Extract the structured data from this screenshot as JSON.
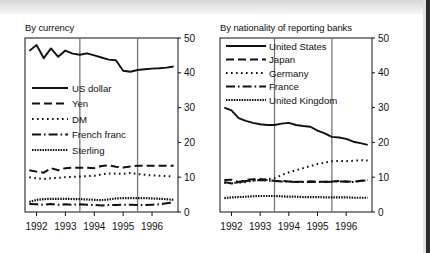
{
  "figure": {
    "background_color": "#ffffff",
    "ink_color": "#111111",
    "gridline_color": "#777777"
  },
  "panels": [
    {
      "id": "by-currency",
      "title": "By currency",
      "chart_data": {
        "type": "line",
        "title": "By currency",
        "xlabel": "",
        "ylabel": "",
        "xlim": [
          1991.6,
          1996.9
        ],
        "ylim": [
          0,
          50
        ],
        "yticks": [
          0,
          10,
          20,
          30,
          40,
          50
        ],
        "xticks": [
          1992,
          1993,
          1994,
          1995,
          1996
        ],
        "xtick_labels": [
          "1992",
          "1993",
          "1994",
          "1995",
          "1996"
        ],
        "grid": "vertical-only",
        "vertical_gridlines": [
          1993.5,
          1995.5
        ],
        "legend_position": "left-middle",
        "series": [
          {
            "name": "US dollar",
            "style": "solid",
            "x": [
              1991.75,
              1992.0,
              1992.25,
              1992.5,
              1992.75,
              1993.0,
              1993.25,
              1993.5,
              1993.75,
              1994.0,
              1994.25,
              1994.5,
              1994.75,
              1995.0,
              1995.25,
              1995.5,
              1995.75,
              1996.0,
              1996.25,
              1996.5,
              1996.75
            ],
            "values": [
              46.3,
              48.0,
              44.2,
              47.0,
              44.6,
              46.4,
              45.5,
              45.2,
              45.6,
              45.0,
              44.4,
              43.8,
              43.6,
              40.6,
              40.3,
              40.8,
              41.0,
              41.2,
              41.3,
              41.5,
              41.8
            ]
          },
          {
            "name": "Yen",
            "style": "dashed",
            "x": [
              1991.75,
              1992.0,
              1992.25,
              1992.5,
              1992.75,
              1993.0,
              1993.25,
              1993.5,
              1993.75,
              1994.0,
              1994.25,
              1994.5,
              1994.75,
              1995.0,
              1995.25,
              1995.5,
              1995.75,
              1996.0,
              1996.25,
              1996.5,
              1996.75
            ],
            "values": [
              12.0,
              11.6,
              11.3,
              12.6,
              12.0,
              12.6,
              12.7,
              12.7,
              12.7,
              12.6,
              13.2,
              13.4,
              13.0,
              12.8,
              13.1,
              13.3,
              13.3,
              13.3,
              13.3,
              13.3,
              13.3
            ]
          },
          {
            "name": "DM",
            "style": "dotted",
            "x": [
              1991.75,
              1992.0,
              1992.25,
              1992.5,
              1992.75,
              1993.0,
              1993.25,
              1993.5,
              1993.75,
              1994.0,
              1994.25,
              1994.5,
              1994.75,
              1995.0,
              1995.25,
              1995.5,
              1995.75,
              1996.0,
              1996.25,
              1996.5,
              1996.75
            ],
            "values": [
              10.0,
              9.7,
              9.5,
              9.7,
              9.8,
              10.0,
              10.1,
              10.2,
              10.3,
              10.4,
              10.8,
              11.1,
              11.0,
              11.0,
              11.2,
              10.9,
              10.7,
              10.5,
              10.4,
              10.3,
              10.2
            ]
          },
          {
            "name": "French franc",
            "style": "dashdot",
            "x": [
              1991.75,
              1992.0,
              1992.25,
              1992.5,
              1992.75,
              1993.0,
              1993.25,
              1993.5,
              1993.75,
              1994.0,
              1994.25,
              1994.5,
              1994.75,
              1995.0,
              1995.25,
              1995.5,
              1995.75,
              1996.0,
              1996.25,
              1996.5,
              1996.75
            ],
            "values": [
              2.3,
              2.2,
              2.1,
              2.3,
              2.1,
              2.2,
              2.1,
              2.2,
              2.1,
              2.0,
              1.9,
              2.0,
              2.0,
              2.1,
              2.1,
              2.0,
              2.0,
              2.1,
              2.2,
              2.5,
              2.8
            ]
          },
          {
            "name": "Sterling",
            "style": "densedot",
            "x": [
              1991.75,
              1992.0,
              1992.25,
              1992.5,
              1992.75,
              1993.0,
              1993.25,
              1993.5,
              1993.75,
              1994.0,
              1994.25,
              1994.5,
              1994.75,
              1995.0,
              1995.25,
              1995.5,
              1995.75,
              1996.0,
              1996.25,
              1996.5,
              1996.75
            ],
            "values": [
              2.9,
              3.5,
              3.7,
              3.8,
              3.8,
              3.8,
              3.7,
              3.7,
              3.6,
              3.5,
              3.4,
              3.6,
              3.9,
              4.0,
              4.0,
              4.0,
              4.0,
              3.9,
              3.8,
              3.7,
              3.5
            ]
          }
        ]
      },
      "legend": [
        {
          "label": "US dollar",
          "style": "solid"
        },
        {
          "label": "Yen",
          "style": "dashed"
        },
        {
          "label": "DM",
          "style": "dotted"
        },
        {
          "label": "French franc",
          "style": "dashdot"
        },
        {
          "label": "Sterling",
          "style": "densedot"
        }
      ]
    },
    {
      "id": "by-nationality-of-reporting-banks",
      "title": "By nationality of reporting banks",
      "chart_data": {
        "type": "line",
        "title": "By nationality of reporting banks",
        "xlabel": "",
        "ylabel": "",
        "xlim": [
          1991.6,
          1996.9
        ],
        "ylim": [
          0,
          50
        ],
        "yticks": [
          0,
          10,
          20,
          30,
          40,
          50
        ],
        "xticks": [
          1992,
          1993,
          1994,
          1995,
          1996
        ],
        "xtick_labels": [
          "1992",
          "1993",
          "1994",
          "1995",
          "1996"
        ],
        "grid": "vertical-only",
        "vertical_gridlines": [
          1993.5,
          1995.5
        ],
        "legend_position": "top-left",
        "series": [
          {
            "name": "United States",
            "style": "solid",
            "x": [
              1991.75,
              1992.0,
              1992.25,
              1992.5,
              1992.75,
              1993.0,
              1993.25,
              1993.5,
              1993.75,
              1994.0,
              1994.25,
              1994.5,
              1994.75,
              1995.0,
              1995.25,
              1995.5,
              1995.75,
              1996.0,
              1996.25,
              1996.5,
              1996.75
            ],
            "values": [
              30.0,
              29.2,
              27.0,
              26.2,
              25.6,
              25.2,
              25.0,
              25.0,
              25.4,
              25.6,
              25.0,
              24.7,
              24.5,
              23.4,
              22.6,
              21.6,
              21.4,
              21.0,
              20.2,
              19.8,
              19.3
            ]
          },
          {
            "name": "Japan",
            "style": "dashed",
            "x": [
              1991.75,
              1992.0,
              1992.25,
              1992.5,
              1992.75,
              1993.0,
              1993.25,
              1993.5,
              1993.75,
              1994.0,
              1994.25,
              1994.5,
              1994.75,
              1995.0,
              1995.25,
              1995.5,
              1995.75,
              1996.0,
              1996.25,
              1996.5,
              1996.75
            ],
            "values": [
              9.2,
              9.3,
              8.6,
              9.2,
              9.4,
              9.5,
              9.2,
              9.0,
              8.9,
              8.8,
              8.7,
              8.7,
              8.8,
              8.7,
              8.7,
              8.8,
              8.9,
              8.8,
              8.7,
              9.0,
              9.2
            ]
          },
          {
            "name": "Germany",
            "style": "dotted",
            "x": [
              1991.75,
              1992.0,
              1992.25,
              1992.5,
              1992.75,
              1993.0,
              1993.25,
              1993.5,
              1993.75,
              1994.0,
              1994.25,
              1994.5,
              1994.75,
              1995.0,
              1995.25,
              1995.5,
              1995.75,
              1996.0,
              1996.25,
              1996.5,
              1996.75
            ],
            "values": [
              8.3,
              8.4,
              8.4,
              8.6,
              9.0,
              9.3,
              9.4,
              9.7,
              10.6,
              11.4,
              12.0,
              12.6,
              13.2,
              13.8,
              14.2,
              14.6,
              14.7,
              14.6,
              14.7,
              14.9,
              14.8
            ]
          },
          {
            "name": "France",
            "style": "dashdot",
            "x": [
              1991.75,
              1992.0,
              1992.25,
              1992.5,
              1992.75,
              1993.0,
              1993.25,
              1993.5,
              1993.75,
              1994.0,
              1994.25,
              1994.5,
              1994.75,
              1995.0,
              1995.25,
              1995.5,
              1995.75,
              1996.0,
              1996.25,
              1996.5,
              1996.75
            ],
            "values": [
              8.6,
              8.2,
              8.5,
              8.9,
              9.0,
              9.2,
              9.0,
              8.9,
              8.8,
              8.7,
              8.6,
              8.6,
              8.7,
              8.6,
              8.6,
              8.7,
              8.8,
              8.7,
              8.6,
              8.9,
              9.1
            ]
          },
          {
            "name": "United Kingdom",
            "style": "densedot",
            "x": [
              1991.75,
              1992.0,
              1992.25,
              1992.5,
              1992.75,
              1993.0,
              1993.25,
              1993.5,
              1993.75,
              1994.0,
              1994.25,
              1994.5,
              1994.75,
              1995.0,
              1995.25,
              1995.5,
              1995.75,
              1996.0,
              1996.25,
              1996.5,
              1996.75
            ],
            "values": [
              4.0,
              4.2,
              4.3,
              4.4,
              4.5,
              4.6,
              4.6,
              4.6,
              4.5,
              4.4,
              4.4,
              4.3,
              4.3,
              4.3,
              4.2,
              4.2,
              4.2,
              4.2,
              4.1,
              4.1,
              4.1
            ]
          }
        ]
      },
      "legend": [
        {
          "label": "United States",
          "style": "solid"
        },
        {
          "label": "Japan",
          "style": "dashed"
        },
        {
          "label": "Germany",
          "style": "dotted"
        },
        {
          "label": "France",
          "style": "dashdot"
        },
        {
          "label": "United Kingdom",
          "style": "densedot"
        }
      ]
    }
  ]
}
